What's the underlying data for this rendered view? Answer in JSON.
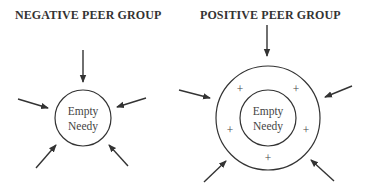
{
  "panels": [
    {
      "title": "NEGATIVE PEER GROUP",
      "center_label_line1": "Empty",
      "center_label_line2": "Needy",
      "arrows": 5,
      "rings": 1
    },
    {
      "title": "POSITIVE PEER GROUP",
      "center_label_line1": "Empty",
      "center_label_line2": "Needy",
      "arrows": 5,
      "rings": 2,
      "ring_marks": [
        "+",
        "+",
        "+",
        "+",
        "+"
      ]
    }
  ],
  "colors": {
    "stroke": "#333333",
    "text": "#444444"
  }
}
